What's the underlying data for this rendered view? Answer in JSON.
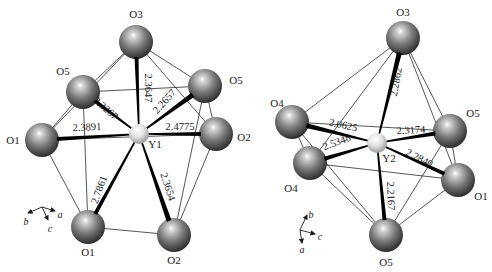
{
  "figure": {
    "colors": {
      "oxygen_light": "#d8d8d8",
      "oxygen_mid": "#7a7a7a",
      "oxygen_dark": "#2e2e2e",
      "yttrium_light": "#ffffff",
      "yttrium_mid": "#e4e4e4",
      "yttrium_dark": "#9a9a9a",
      "bond": "#000000",
      "edge": "#2a2a2a"
    },
    "polyhedra": [
      {
        "name": "Y1",
        "center": {
          "id": "Y1",
          "label": "Y1",
          "x": 139,
          "y": 134,
          "r": 10,
          "lx": 155,
          "ly": 148
        },
        "atoms": [
          {
            "id": "O3",
            "label": "O3",
            "x": 136,
            "y": 42,
            "r": 17,
            "lx": 136,
            "ly": 18
          },
          {
            "id": "O5a",
            "label": "O5",
            "x": 83,
            "y": 92,
            "r": 17,
            "lx": 63,
            "ly": 75
          },
          {
            "id": "O5b",
            "label": "O5",
            "x": 205,
            "y": 86,
            "r": 17,
            "lx": 236,
            "ly": 84
          },
          {
            "id": "O1a",
            "label": "O1",
            "x": 42,
            "y": 140,
            "r": 17,
            "lx": 13,
            "ly": 144
          },
          {
            "id": "O2a",
            "label": "O2",
            "x": 216,
            "y": 134,
            "r": 17,
            "lx": 244,
            "ly": 141
          },
          {
            "id": "O1b",
            "label": "O1",
            "x": 88,
            "y": 227,
            "r": 17,
            "lx": 88,
            "ly": 256
          },
          {
            "id": "O2b",
            "label": "O2",
            "x": 174,
            "y": 235,
            "r": 17,
            "lx": 174,
            "ly": 264
          }
        ],
        "bonds": [
          {
            "to": "O3",
            "value": "2.3647",
            "width": 4,
            "lx": 147,
            "ly": 88,
            "angle": 90
          },
          {
            "to": "O5a",
            "value": "2.3267",
            "width": 4,
            "lx": 105,
            "ly": 109,
            "angle": 42
          },
          {
            "to": "O5b",
            "value": "2.2657",
            "width": 5,
            "lx": 165,
            "ly": 102,
            "angle": -48
          },
          {
            "to": "O1a",
            "value": "2.3891",
            "width": 4,
            "lx": 87,
            "ly": 128,
            "angle": -3
          },
          {
            "to": "O2a",
            "value": "2.4775",
            "width": 4,
            "lx": 180,
            "ly": 128,
            "angle": 0
          },
          {
            "to": "O1b",
            "value": "2.7861",
            "width": 4,
            "lx": 100,
            "ly": 190,
            "angle": -70
          },
          {
            "to": "O2b",
            "value": "2.3654",
            "width": 5,
            "lx": 167,
            "ly": 187,
            "angle": 72
          }
        ],
        "edges": [
          [
            "O3",
            "O5a"
          ],
          [
            "O3",
            "O5b"
          ],
          [
            "O3",
            "O1a"
          ],
          [
            "O3",
            "O2a"
          ],
          [
            "O5a",
            "O5b"
          ],
          [
            "O5a",
            "O1a"
          ],
          [
            "O5a",
            "O1b"
          ],
          [
            "O5b",
            "O2a"
          ],
          [
            "O5b",
            "O2b"
          ],
          [
            "O1a",
            "O1b"
          ],
          [
            "O1a",
            "O2a"
          ],
          [
            "O2a",
            "O2b"
          ],
          [
            "O1b",
            "O2b"
          ]
        ],
        "axes": {
          "origin": {
            "x": 42,
            "y": 207
          },
          "items": [
            {
              "label": "b",
              "dx": -14,
              "dy": 6,
              "lx": 26,
              "ly": 225
            },
            {
              "label": "c",
              "dx": 6,
              "dy": 13,
              "lx": 50,
              "ly": 232
            },
            {
              "label": "a",
              "dx": 13,
              "dy": 4,
              "lx": 60,
              "ly": 218
            }
          ]
        }
      },
      {
        "name": "Y2",
        "center": {
          "id": "Y2",
          "label": "Y2",
          "x": 377,
          "y": 143,
          "r": 10,
          "lx": 389,
          "ly": 162
        },
        "atoms": [
          {
            "id": "O3",
            "label": "O3",
            "x": 403,
            "y": 38,
            "r": 17,
            "lx": 403,
            "ly": 16
          },
          {
            "id": "O4a",
            "label": "O4",
            "x": 292,
            "y": 122,
            "r": 17,
            "lx": 277,
            "ly": 107
          },
          {
            "id": "O5a",
            "label": "O5",
            "x": 450,
            "y": 131,
            "r": 17,
            "lx": 473,
            "ly": 117
          },
          {
            "id": "O4b",
            "label": "O4",
            "x": 310,
            "y": 163,
            "r": 17,
            "lx": 291,
            "ly": 192
          },
          {
            "id": "O1a",
            "label": "O1",
            "x": 458,
            "y": 180,
            "r": 17,
            "lx": 481,
            "ly": 200
          },
          {
            "id": "O5b",
            "label": "O5",
            "x": 386,
            "y": 235,
            "r": 17,
            "lx": 386,
            "ly": 266
          }
        ],
        "bonds": [
          {
            "to": "O3",
            "value": "2.2862",
            "width": 5,
            "lx": 397,
            "ly": 82,
            "angle": -80
          },
          {
            "to": "O4a",
            "value": "2.0625",
            "width": 5,
            "lx": 343,
            "ly": 126,
            "angle": 12
          },
          {
            "to": "O5a",
            "value": "2.3174",
            "width": 4,
            "lx": 411,
            "ly": 131,
            "angle": -3
          },
          {
            "to": "O4b",
            "value": "2.5348",
            "width": 4,
            "lx": 337,
            "ly": 143,
            "angle": -20
          },
          {
            "to": "O1a",
            "value": "2.2840",
            "width": 4,
            "lx": 419,
            "ly": 159,
            "angle": 27
          },
          {
            "to": "O5b",
            "value": "2.2167",
            "width": 4,
            "lx": 390,
            "ly": 196,
            "angle": 88
          }
        ],
        "edges": [
          [
            "O3",
            "O4a"
          ],
          [
            "O3",
            "O5a"
          ],
          [
            "O3",
            "O1a"
          ],
          [
            "O3",
            "O4b"
          ],
          [
            "O4a",
            "O5a"
          ],
          [
            "O4a",
            "O4b"
          ],
          [
            "O4b",
            "O1a"
          ],
          [
            "O4b",
            "O5b"
          ],
          [
            "O4a",
            "O5b"
          ],
          [
            "O5a",
            "O1a"
          ],
          [
            "O5a",
            "O5b"
          ],
          [
            "O1a",
            "O5b"
          ]
        ],
        "axes": {
          "origin": {
            "x": 300,
            "y": 230
          },
          "items": [
            {
              "label": "b",
              "dx": 7,
              "dy": -15,
              "lx": 311,
              "ly": 218
            },
            {
              "label": "c",
              "dx": 15,
              "dy": 4,
              "lx": 320,
              "ly": 240
            },
            {
              "label": "a",
              "dx": 2,
              "dy": 13,
              "lx": 302,
              "ly": 253
            }
          ]
        }
      }
    ]
  }
}
